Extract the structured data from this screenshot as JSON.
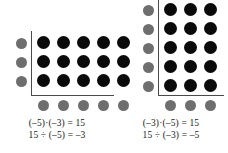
{
  "figure": {
    "type": "integer-array-model",
    "background_color": "#ffffff",
    "dot_colors": {
      "product": "#0a0a0a",
      "factor_marker": "#6e6e6e"
    },
    "axis_color": "#4a4a4a"
  },
  "panels": [
    {
      "id": "left",
      "name": "negative-five-times-negative-three",
      "rows": 3,
      "columns": 5,
      "row_marker_count": 3,
      "column_marker_count": 5,
      "total_dots": 15,
      "equations": [
        "(–5)·(–3) = 15",
        "15 ÷ (–5) = –3"
      ],
      "factors": [
        -5,
        -3
      ],
      "product": 15,
      "quotient": -3
    },
    {
      "id": "right",
      "name": "negative-three-times-negative-five",
      "rows": 5,
      "columns": 3,
      "row_marker_count": 5,
      "column_marker_count": 3,
      "total_dots": 15,
      "equations": [
        "(–3)·(–5) = 15",
        "15 ÷ (–3) = –5"
      ],
      "factors": [
        -3,
        -5
      ],
      "product": 15,
      "quotient": -5
    }
  ]
}
